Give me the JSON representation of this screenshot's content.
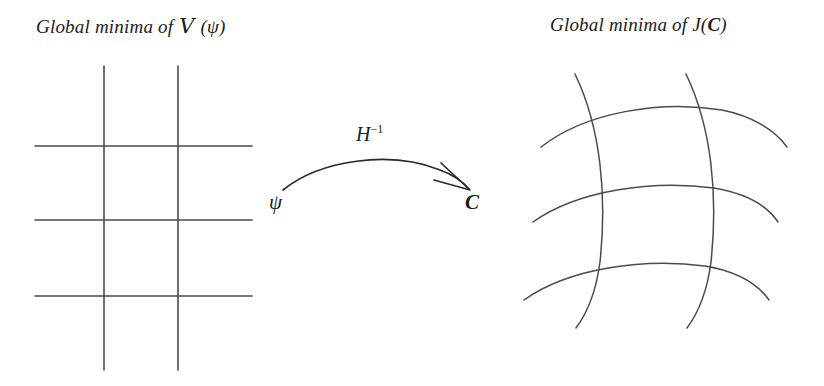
{
  "figure": {
    "width": 824,
    "height": 386,
    "background": "#ffffff",
    "line_color": "#4a4a50",
    "text_color": "#1c1c1c",
    "arrow_color": "#2a2a2e"
  },
  "captions": {
    "left_prefix": "Global minima of ",
    "left_symbol": "V",
    "left_suffix": " (ψ)",
    "right_prefix": "Global minima of ",
    "right_function": "J(",
    "right_symbol": "C",
    "right_suffix": ")"
  },
  "arrow": {
    "map_label": "H",
    "map_exponent": "−1",
    "source_label": "ψ",
    "target_label": "C"
  },
  "left_grid": {
    "name": "rectilinear-grid",
    "description": "Cartesian grid of straight lines in psi coordinates",
    "vertical_lines": [
      {
        "x": 104,
        "y_start": 66,
        "y_end": 370
      },
      {
        "x": 178,
        "y_start": 66,
        "y_end": 370
      }
    ],
    "horizontal_lines": [
      {
        "y": 146,
        "x_start": 35,
        "x_end": 252
      },
      {
        "y": 220,
        "x_start": 35,
        "x_end": 252
      },
      {
        "y": 296,
        "x_start": 35,
        "x_end": 252
      }
    ]
  },
  "right_grid": {
    "name": "curvilinear-grid",
    "description": "Deformed grid of curved lines in C coordinates",
    "curved_verticals": [
      "M 575 74 C 601 128, 607 196, 600 262 C 596 292, 588 312, 576 328",
      "M 686 74 C 712 128, 718 196, 711 262 C 707 292, 699 312, 687 328"
    ],
    "curved_horizontals": [
      "M 541 147 C 586 112, 660 100, 722 110 C 752 116, 775 130, 787 147",
      "M 533 222 C 578 190, 652 180, 714 188 C 744 193, 766 204, 778 222",
      "M 524 300 C 569 268, 643 258, 705 266 C 735 271, 757 283, 769 300"
    ]
  }
}
